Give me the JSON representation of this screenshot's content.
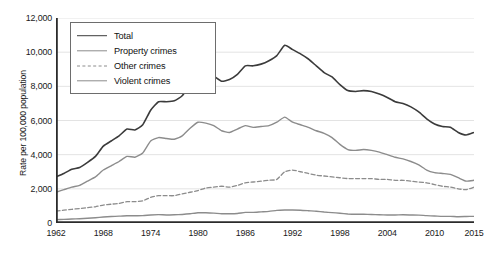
{
  "chart_data": {
    "type": "line",
    "title": "",
    "xlabel": "",
    "ylabel": "Rate per 100,000 population",
    "xlim": [
      1962,
      2015
    ],
    "ylim": [
      0,
      12000
    ],
    "grid": true,
    "legend_position": "top-left",
    "y_ticks": [
      "0",
      "2,000",
      "4,000",
      "6,000",
      "8,000",
      "10,000",
      "12,000"
    ],
    "y_tick_values": [
      0,
      2000,
      4000,
      6000,
      8000,
      10000,
      12000
    ],
    "x_ticks": [
      "1962",
      "1968",
      "1974",
      "1980",
      "1986",
      "1992",
      "1998",
      "2004",
      "2010",
      "2015"
    ],
    "x_tick_values": [
      1962,
      1968,
      1974,
      1980,
      1986,
      1992,
      1998,
      2004,
      2010,
      2015
    ],
    "x": [
      1962,
      1963,
      1964,
      1965,
      1966,
      1967,
      1968,
      1969,
      1970,
      1971,
      1972,
      1973,
      1974,
      1975,
      1976,
      1977,
      1978,
      1979,
      1980,
      1981,
      1982,
      1983,
      1984,
      1985,
      1986,
      1987,
      1988,
      1989,
      1990,
      1991,
      1992,
      1993,
      1994,
      1995,
      1996,
      1997,
      1998,
      1999,
      2000,
      2001,
      2002,
      2003,
      2004,
      2005,
      2006,
      2007,
      2008,
      2009,
      2010,
      2011,
      2012,
      2013,
      2014,
      2015
    ],
    "series": [
      {
        "name": "Total",
        "color": "#3b3b3b",
        "style": "solid",
        "width": 1.6,
        "values": [
          2700,
          2900,
          3150,
          3250,
          3550,
          3900,
          4500,
          4800,
          5100,
          5500,
          5450,
          5750,
          6600,
          7100,
          7100,
          7150,
          7450,
          8100,
          8750,
          8800,
          8600,
          8300,
          8400,
          8700,
          9200,
          9200,
          9300,
          9500,
          9800,
          10400,
          10150,
          9900,
          9600,
          9200,
          8800,
          8550,
          8100,
          7750,
          7700,
          7750,
          7700,
          7550,
          7350,
          7100,
          7000,
          6800,
          6500,
          6100,
          5800,
          5650,
          5600,
          5300,
          5150,
          5300
        ]
      },
      {
        "name": "Property crimes",
        "color": "#8c8c8c",
        "style": "solid",
        "width": 1.4,
        "values": [
          1800,
          1950,
          2100,
          2200,
          2450,
          2700,
          3100,
          3350,
          3600,
          3900,
          3850,
          4100,
          4800,
          5000,
          4950,
          4900,
          5100,
          5550,
          5900,
          5850,
          5700,
          5400,
          5300,
          5500,
          5700,
          5600,
          5650,
          5700,
          5900,
          6200,
          5900,
          5750,
          5600,
          5400,
          5250,
          5000,
          4600,
          4300,
          4250,
          4300,
          4250,
          4150,
          4000,
          3850,
          3750,
          3600,
          3400,
          3100,
          2950,
          2900,
          2850,
          2650,
          2450,
          2500
        ]
      },
      {
        "name": "Other crimes",
        "color": "#8c8c8c",
        "style": "dashed",
        "width": 1.3,
        "values": [
          700,
          750,
          800,
          850,
          900,
          950,
          1050,
          1100,
          1150,
          1250,
          1250,
          1300,
          1500,
          1600,
          1600,
          1600,
          1700,
          1800,
          1900,
          2050,
          2100,
          2150,
          2100,
          2200,
          2350,
          2400,
          2450,
          2500,
          2550,
          3000,
          3100,
          3000,
          2900,
          2800,
          2750,
          2700,
          2650,
          2600,
          2600,
          2600,
          2600,
          2550,
          2550,
          2500,
          2500,
          2450,
          2400,
          2350,
          2250,
          2150,
          2100,
          2000,
          1950,
          2100
        ]
      },
      {
        "name": "Violent crimes",
        "color": "#8c8c8c",
        "style": "solid",
        "width": 1.4,
        "values": [
          200,
          210,
          230,
          250,
          280,
          310,
          350,
          380,
          400,
          420,
          420,
          430,
          470,
          490,
          470,
          480,
          500,
          540,
          600,
          600,
          580,
          540,
          540,
          560,
          620,
          620,
          650,
          680,
          740,
          760,
          760,
          750,
          720,
          690,
          640,
          610,
          570,
          530,
          510,
          510,
          500,
          480,
          470,
          470,
          480,
          470,
          460,
          430,
          410,
          390,
          390,
          370,
          380,
          390
        ]
      }
    ]
  },
  "legend": {
    "items": [
      {
        "label": "Total"
      },
      {
        "label": "Property crimes"
      },
      {
        "label": "Other crimes"
      },
      {
        "label": "Violent crimes"
      }
    ]
  },
  "axes": {
    "y_label": "Rate per 100,000 population"
  }
}
